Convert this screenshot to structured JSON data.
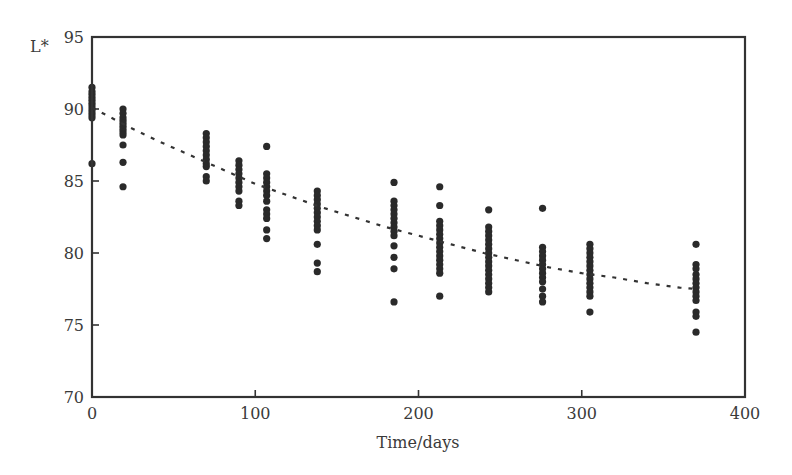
{
  "chart_data": {
    "type": "scatter",
    "title": "",
    "xlabel": "Time/days",
    "ylabel": "L*",
    "xlim": [
      0,
      400
    ],
    "ylim": [
      70,
      95
    ],
    "xticks": [
      0,
      100,
      200,
      300,
      400
    ],
    "yticks": [
      70,
      75,
      80,
      85,
      90,
      95
    ],
    "grid": false,
    "legend": "none",
    "colors": {
      "points": "#2a2a2a",
      "axes": "#333333",
      "fit": "#333333"
    },
    "series": [
      {
        "name": "measurements",
        "kind": "scatter",
        "points": [
          [
            0,
            91.5
          ],
          [
            0,
            91.2
          ],
          [
            0,
            91.0
          ],
          [
            0,
            90.8
          ],
          [
            0,
            90.6
          ],
          [
            0,
            90.4
          ],
          [
            0,
            90.2
          ],
          [
            0,
            90.0
          ],
          [
            0,
            89.8
          ],
          [
            0,
            89.6
          ],
          [
            0,
            89.4
          ],
          [
            0,
            86.2
          ],
          [
            19,
            90.0
          ],
          [
            19,
            89.7
          ],
          [
            19,
            89.4
          ],
          [
            19,
            89.2
          ],
          [
            19,
            89.0
          ],
          [
            19,
            88.8
          ],
          [
            19,
            88.6
          ],
          [
            19,
            88.4
          ],
          [
            19,
            88.2
          ],
          [
            19,
            87.5
          ],
          [
            19,
            86.3
          ],
          [
            19,
            84.6
          ],
          [
            70,
            88.3
          ],
          [
            70,
            88.0
          ],
          [
            70,
            87.7
          ],
          [
            70,
            87.4
          ],
          [
            70,
            87.1
          ],
          [
            70,
            86.8
          ],
          [
            70,
            86.5
          ],
          [
            70,
            86.2
          ],
          [
            70,
            86.0
          ],
          [
            70,
            85.3
          ],
          [
            70,
            85.0
          ],
          [
            90,
            86.4
          ],
          [
            90,
            86.1
          ],
          [
            90,
            85.8
          ],
          [
            90,
            85.5
          ],
          [
            90,
            85.2
          ],
          [
            90,
            84.9
          ],
          [
            90,
            84.6
          ],
          [
            90,
            84.3
          ],
          [
            90,
            83.6
          ],
          [
            90,
            83.3
          ],
          [
            107,
            87.4
          ],
          [
            107,
            85.5
          ],
          [
            107,
            85.2
          ],
          [
            107,
            84.9
          ],
          [
            107,
            84.6
          ],
          [
            107,
            84.3
          ],
          [
            107,
            84.0
          ],
          [
            107,
            83.6
          ],
          [
            107,
            83.0
          ],
          [
            107,
            82.7
          ],
          [
            107,
            82.4
          ],
          [
            107,
            81.6
          ],
          [
            107,
            81.0
          ],
          [
            138,
            84.3
          ],
          [
            138,
            84.0
          ],
          [
            138,
            83.7
          ],
          [
            138,
            83.4
          ],
          [
            138,
            83.1
          ],
          [
            138,
            82.8
          ],
          [
            138,
            82.5
          ],
          [
            138,
            82.2
          ],
          [
            138,
            81.9
          ],
          [
            138,
            81.6
          ],
          [
            138,
            80.6
          ],
          [
            138,
            79.3
          ],
          [
            138,
            78.7
          ],
          [
            185,
            84.9
          ],
          [
            185,
            83.6
          ],
          [
            185,
            83.3
          ],
          [
            185,
            83.0
          ],
          [
            185,
            82.7
          ],
          [
            185,
            82.4
          ],
          [
            185,
            82.1
          ],
          [
            185,
            81.8
          ],
          [
            185,
            81.5
          ],
          [
            185,
            81.2
          ],
          [
            185,
            80.5
          ],
          [
            185,
            79.7
          ],
          [
            185,
            78.9
          ],
          [
            185,
            76.6
          ],
          [
            213,
            84.6
          ],
          [
            213,
            83.3
          ],
          [
            213,
            82.2
          ],
          [
            213,
            81.9
          ],
          [
            213,
            81.6
          ],
          [
            213,
            81.3
          ],
          [
            213,
            81.0
          ],
          [
            213,
            80.7
          ],
          [
            213,
            80.4
          ],
          [
            213,
            80.1
          ],
          [
            213,
            79.8
          ],
          [
            213,
            79.5
          ],
          [
            213,
            79.2
          ],
          [
            213,
            78.9
          ],
          [
            213,
            78.6
          ],
          [
            213,
            77.0
          ],
          [
            243,
            83.0
          ],
          [
            243,
            81.8
          ],
          [
            243,
            81.5
          ],
          [
            243,
            81.2
          ],
          [
            243,
            80.9
          ],
          [
            243,
            80.6
          ],
          [
            243,
            80.3
          ],
          [
            243,
            80.0
          ],
          [
            243,
            79.7
          ],
          [
            243,
            79.4
          ],
          [
            243,
            79.1
          ],
          [
            243,
            78.8
          ],
          [
            243,
            78.5
          ],
          [
            243,
            78.2
          ],
          [
            243,
            77.9
          ],
          [
            243,
            77.6
          ],
          [
            243,
            77.3
          ],
          [
            276,
            83.1
          ],
          [
            276,
            80.4
          ],
          [
            276,
            80.1
          ],
          [
            276,
            79.8
          ],
          [
            276,
            79.5
          ],
          [
            276,
            79.2
          ],
          [
            276,
            78.9
          ],
          [
            276,
            78.6
          ],
          [
            276,
            78.3
          ],
          [
            276,
            78.0
          ],
          [
            276,
            77.5
          ],
          [
            276,
            77.0
          ],
          [
            276,
            76.6
          ],
          [
            305,
            80.6
          ],
          [
            305,
            80.3
          ],
          [
            305,
            80.0
          ],
          [
            305,
            79.7
          ],
          [
            305,
            79.4
          ],
          [
            305,
            79.1
          ],
          [
            305,
            78.8
          ],
          [
            305,
            78.5
          ],
          [
            305,
            78.2
          ],
          [
            305,
            77.9
          ],
          [
            305,
            77.6
          ],
          [
            305,
            77.3
          ],
          [
            305,
            77.0
          ],
          [
            305,
            75.9
          ],
          [
            370,
            80.6
          ],
          [
            370,
            79.2
          ],
          [
            370,
            78.9
          ],
          [
            370,
            78.5
          ],
          [
            370,
            78.2
          ],
          [
            370,
            77.9
          ],
          [
            370,
            77.6
          ],
          [
            370,
            77.3
          ],
          [
            370,
            77.0
          ],
          [
            370,
            76.7
          ],
          [
            370,
            75.9
          ],
          [
            370,
            75.6
          ],
          [
            370,
            74.5
          ]
        ]
      },
      {
        "name": "fitted-curve",
        "kind": "line",
        "style": "dotted",
        "x": [
          0,
          20,
          40,
          60,
          80,
          100,
          120,
          140,
          160,
          180,
          200,
          220,
          240,
          260,
          280,
          300,
          320,
          340,
          360,
          370
        ],
        "y": [
          90.1,
          88.9,
          87.8,
          86.8,
          85.8,
          84.8,
          84.0,
          83.2,
          82.5,
          81.8,
          81.2,
          80.6,
          80.0,
          79.5,
          79.0,
          78.6,
          78.3,
          77.9,
          77.6,
          77.5
        ]
      }
    ]
  }
}
